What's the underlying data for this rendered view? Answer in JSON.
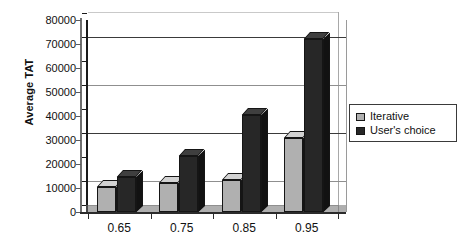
{
  "chart_data": {
    "type": "bar",
    "title": "",
    "xlabel": "",
    "ylabel": "Average TAT",
    "categories": [
      "0.65",
      "0.75",
      "0.85",
      "0.95"
    ],
    "series": [
      {
        "name": "Iterative",
        "values": [
          10500,
          12000,
          13500,
          31000
        ],
        "color": "#b0b0b0"
      },
      {
        "name": "User's choice",
        "values": [
          14500,
          23500,
          40500,
          72000
        ],
        "color": "#272727"
      }
    ],
    "ylim": [
      0,
      80000
    ],
    "ytick_values": [
      0,
      10000,
      20000,
      30000,
      40000,
      50000,
      60000,
      70000,
      80000
    ],
    "ytick_labels": [
      "0",
      "10000",
      "20000",
      "30000",
      "40000",
      "50000",
      "60000",
      "70000",
      "80000"
    ],
    "grid": true,
    "gridline_values": [
      10000,
      30000,
      50000,
      70000
    ],
    "legend_position": "right",
    "style": "3d-column"
  },
  "legend": {
    "items": [
      {
        "label": "Iterative",
        "swatch": "legend-swatch-iterative"
      },
      {
        "label": "User's choice",
        "swatch": "legend-swatch-users-choice"
      }
    ]
  }
}
